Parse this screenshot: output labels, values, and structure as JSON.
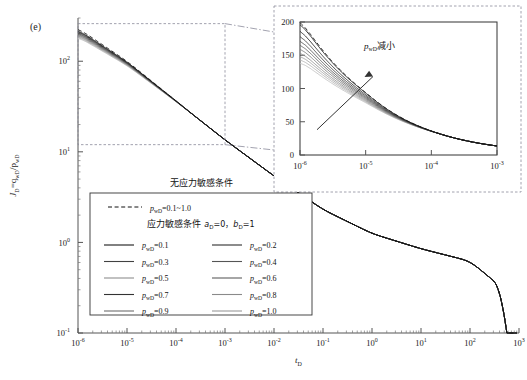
{
  "figure": {
    "panel_label": "(e)",
    "background": "#ffffff"
  },
  "chart_data": {
    "type": "line",
    "title": "",
    "xlabel": "t_D",
    "ylabel": "J_D=q_wD/p_wD",
    "xscale": "log",
    "yscale": "log",
    "xlim": [
      1e-06,
      1000
    ],
    "ylim": [
      0.1,
      300
    ],
    "grid": false,
    "x_tick_labels": [
      "10-6",
      "10-5",
      "10-4",
      "10-3",
      "10-2",
      "10-1",
      "100",
      "101",
      "102",
      "103"
    ],
    "x_tick_mantissa": [
      "10",
      "10",
      "10",
      "10",
      "10",
      "10",
      "10",
      "10",
      "10",
      "10"
    ],
    "x_tick_exponents": [
      "-6",
      "-5",
      "-4",
      "-3",
      "-2",
      "-1",
      "0",
      "1",
      "2",
      "3"
    ],
    "y_tick_mantissa": [
      "10",
      "10",
      "10",
      "10"
    ],
    "y_tick_exponents": [
      "-1",
      "0",
      "1",
      "2"
    ],
    "y_tick_values": [
      0.1,
      1,
      10,
      100
    ],
    "legend_position": "lower-left-inside",
    "series": [
      {
        "name": "p_wD=0.1~1.0 (no stress sensitivity)",
        "style": "dashed",
        "color": "#111111",
        "p_wD": "0.1~1.0"
      },
      {
        "name": "p_wD=0.1",
        "style": "solid",
        "color": "#1a1a1a",
        "p_wD": 0.1
      },
      {
        "name": "p_wD=0.2",
        "style": "solid",
        "color": "#2e2e2e",
        "p_wD": 0.2
      },
      {
        "name": "p_wD=0.3",
        "style": "solid",
        "color": "#414141",
        "p_wD": 0.3
      },
      {
        "name": "p_wD=0.4",
        "style": "solid",
        "color": "#555555",
        "p_wD": 0.4
      },
      {
        "name": "p_wD=0.5",
        "style": "solid",
        "color": "#696969",
        "p_wD": 0.5
      },
      {
        "name": "p_wD=0.6",
        "style": "solid",
        "color": "#7d7d7d",
        "p_wD": 0.6
      },
      {
        "name": "p_wD=0.7",
        "style": "solid",
        "color": "#909090",
        "p_wD": 0.7
      },
      {
        "name": "p_wD=0.8",
        "style": "solid",
        "color": "#a4a4a4",
        "p_wD": 0.8
      },
      {
        "name": "p_wD=0.9",
        "style": "solid",
        "color": "#b4b4b4",
        "p_wD": 0.9
      },
      {
        "name": "p_wD=1.0",
        "style": "solid",
        "color": "#c2c2c2",
        "p_wD": 1.0
      }
    ],
    "main_curve_points_log": [
      {
        "x": 1e-06,
        "y": 200
      },
      {
        "x": 1e-05,
        "y": 93
      },
      {
        "x": 0.0001,
        "y": 36
      },
      {
        "x": 0.001,
        "y": 13.5
      },
      {
        "x": 0.01,
        "y": 5.4
      },
      {
        "x": 0.1,
        "y": 2.3
      },
      {
        "x": 1,
        "y": 1.25
      },
      {
        "x": 10,
        "y": 0.85
      },
      {
        "x": 100,
        "y": 0.62
      },
      {
        "x": 500,
        "y": 0.3
      },
      {
        "x": 900,
        "y": 0.1
      }
    ],
    "inset": {
      "type": "line",
      "xscale": "log",
      "yscale": "linear",
      "xlim": [
        1e-06,
        0.001
      ],
      "ylim": [
        0,
        200
      ],
      "y_ticks": [
        0,
        50,
        100,
        150,
        200
      ],
      "x_tick_mantissa": [
        "10",
        "10",
        "10",
        "10"
      ],
      "x_tick_exponents": [
        "-6",
        "-5",
        "-4",
        "-3"
      ],
      "annotation": "p",
      "annotation_sub": "wD",
      "annotation_cn": "减小",
      "annotation_arrow": "up-right",
      "curves_top_values": [
        196,
        186,
        178,
        171,
        165,
        159,
        153,
        148,
        143,
        138
      ],
      "curves_end_value": 12
    },
    "zoom_box": {
      "x_range": [
        1e-06,
        0.001
      ],
      "y_range": [
        12,
        260
      ],
      "style": "dashed"
    }
  },
  "legend": {
    "header_no_stress": "无应力敏感条件",
    "dashed_entry": {
      "symbol": "dashed",
      "p": "p",
      "sub": "wD",
      "value": "=0.1~1.0"
    },
    "header_stress": "应力敏感条件",
    "header_stress_params": {
      "a": "a",
      "a_sub": "D",
      "a_val": "=0，",
      "b": "b",
      "b_sub": "D",
      "b_val": "=1"
    },
    "entries": [
      {
        "p": "p",
        "sub": "wD",
        "value": "=0.1",
        "color": "#1a1a1a"
      },
      {
        "p": "p",
        "sub": "wD",
        "value": "=0.2",
        "color": "#2e2e2e"
      },
      {
        "p": "p",
        "sub": "wD",
        "value": "=0.3",
        "color": "#414141"
      },
      {
        "p": "p",
        "sub": "wD",
        "value": "=0.4",
        "color": "#555555"
      },
      {
        "p": "p",
        "sub": "wD",
        "value": "=0.5",
        "color": "#8e8e8e"
      },
      {
        "p": "p",
        "sub": "wD",
        "value": "=0.6",
        "color": "#5e5e5e"
      },
      {
        "p": "p",
        "sub": "wD",
        "value": "=0.7",
        "color": "#333333"
      },
      {
        "p": "p",
        "sub": "wD",
        "value": "=0.8",
        "color": "#8a8a8a"
      },
      {
        "p": "p",
        "sub": "wD",
        "value": "=0.9",
        "color": "#6e6e6e"
      },
      {
        "p": "p",
        "sub": "wD",
        "value": "=1.0",
        "color": "#9a9a9a"
      }
    ]
  },
  "axes": {
    "x_title_main": "t",
    "x_title_sub": "D",
    "y_title_main": "J",
    "y_title_sub1": "D",
    "y_title_mid": "=q",
    "y_title_sub2": "wD",
    "y_title_div": "/p",
    "y_title_sub3": "wD"
  }
}
